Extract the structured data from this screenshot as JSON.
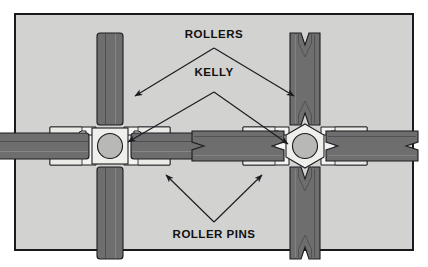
{
  "figure": {
    "background_color": "#d2d2d0",
    "border_color": "#1d1a1f",
    "page_color": "#ffffff"
  },
  "labels": {
    "rollers": "ROLLERS",
    "kelly": "KELLY",
    "roller_pins": "ROLLER PINS"
  },
  "colors": {
    "roller_fill": "#6e6e6e",
    "roller_fill_dark": "#5c5c5c",
    "roller_fill_light": "#7d7d7d",
    "housing_fill": "#f4f4f2",
    "housing_shadow": "#dcdcda",
    "kelly_fill": "#efefec",
    "bore_fill": "#b8b8b6",
    "outline": "#1d1a1f",
    "leader": "#1d1a1f"
  },
  "assemblies": [
    {
      "name": "square-kelly-assembly",
      "side": "left",
      "kelly_shape": "square",
      "bore_shape": "circle",
      "roller_profile": "straight",
      "center_x": 110,
      "center_y": 146,
      "roller_count": 4,
      "roller_pin_count": 4
    },
    {
      "name": "hex-kelly-assembly",
      "side": "right",
      "kelly_shape": "hexagon",
      "bore_shape": "circle",
      "roller_profile": "concave",
      "center_x": 305,
      "center_y": 146,
      "roller_count": 4,
      "roller_pin_count": 4
    }
  ],
  "leaders": [
    {
      "name": "rollers-to-left-roller",
      "from": "ROLLERS",
      "to": "left vertical roller"
    },
    {
      "name": "rollers-to-right-roller",
      "from": "ROLLERS",
      "to": "right vertical roller"
    },
    {
      "name": "kelly-to-left-bore",
      "from": "KELLY",
      "to": "left kelly bore"
    },
    {
      "name": "kelly-to-right-bore",
      "from": "KELLY",
      "to": "right kelly bore"
    },
    {
      "name": "pins-to-left-housing",
      "from": "ROLLER PINS",
      "to": "left lower-right housing"
    },
    {
      "name": "pins-to-right-housing",
      "from": "ROLLER PINS",
      "to": "right lower-left housing"
    }
  ]
}
